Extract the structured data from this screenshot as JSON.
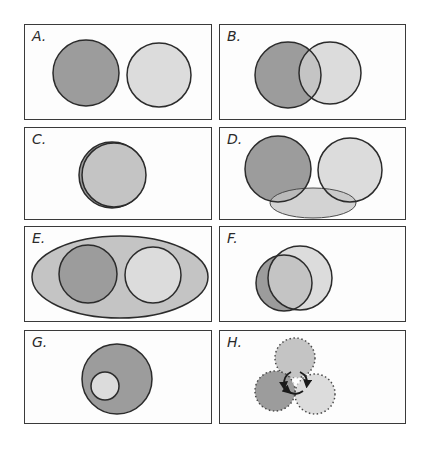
{
  "colors": {
    "dark": "#9c9c9c",
    "light": "#dcdcdc",
    "medium": "#c4c4c4",
    "outline": "#2b2b2b"
  },
  "panels": [
    {
      "id": "A",
      "label": "A.",
      "description": "Two separate non-overlapping circles (dark, light)"
    },
    {
      "id": "B",
      "label": "B.",
      "description": "Two overlapping circles (dark, light)"
    },
    {
      "id": "C",
      "label": "C.",
      "description": "Two nearly coincident circles"
    },
    {
      "id": "D",
      "label": "D.",
      "description": "Two separate circles with an ellipse overlapping both at the bottom"
    },
    {
      "id": "E",
      "label": "E.",
      "description": "Large ellipse containing two separate circles"
    },
    {
      "id": "F",
      "label": "F.",
      "description": "Two heavily overlapping circles"
    },
    {
      "id": "G",
      "label": "G.",
      "description": "Small light circle contained inside larger dark circle"
    },
    {
      "id": "H",
      "label": "H.",
      "description": "Three dotted-outline overlapping circles with cyclic arrows in the center"
    }
  ]
}
